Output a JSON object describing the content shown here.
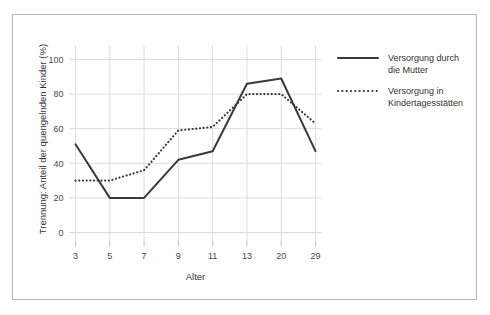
{
  "chart_data": {
    "type": "line",
    "title": "",
    "subtitle": "",
    "xlabel": "Alter",
    "ylabel": "Trennung: Anteil der quengelnden Kinder (%)",
    "categories": [
      "3",
      "5",
      "7",
      "9",
      "11",
      "13",
      "20",
      "29"
    ],
    "x_tick_labels": [
      "3",
      "5",
      "7",
      "9",
      "11",
      "13",
      "20",
      "29"
    ],
    "y_tick_labels": [
      "0",
      "20",
      "40",
      "60",
      "80",
      "100"
    ],
    "y_ticks": [
      0,
      20,
      40,
      60,
      80,
      100
    ],
    "ylim": [
      0,
      108
    ],
    "grid": "both",
    "legend_position": "right",
    "series": [
      {
        "name": "Versorgung durch die Mutter",
        "style": "solid",
        "color": "#3a3a3a",
        "values": [
          51,
          20,
          20,
          42,
          47,
          86,
          89,
          47
        ]
      },
      {
        "name": "Versorgung in Kindertagesstätten",
        "style": "dotted",
        "color": "#3a3a3a",
        "values": [
          30,
          30,
          36,
          59,
          61,
          80,
          80,
          63
        ]
      }
    ]
  },
  "legend": {
    "items": [
      {
        "label_line1": "Versorgung durch",
        "label_line2": "die Mutter",
        "style": "solid"
      },
      {
        "label_line1": "Versorgung in",
        "label_line2": "Kindertagesstätten",
        "style": "dotted"
      }
    ]
  },
  "colors": {
    "line": "#3a3a3a",
    "grid": "#dcdcdc",
    "axis_text": "#4a4a4a",
    "frame_border": "#b9b9b9",
    "background": "#ffffff"
  }
}
